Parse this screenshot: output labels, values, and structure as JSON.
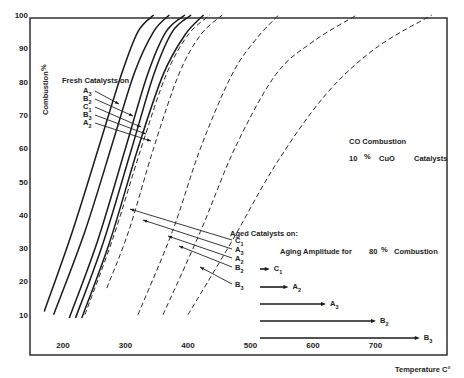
{
  "chart_data": {
    "type": "line",
    "title": "CO Combustion",
    "subtitle": "10 % CuO Catalysts",
    "xlabel": "Temperature C°",
    "ylabel": "Combustion %",
    "xlim": [
      150,
      810
    ],
    "ylim": [
      0,
      100
    ],
    "x_ticks": [
      "200",
      "300",
      "400",
      "500",
      "600",
      "700"
    ],
    "y_ticks": [
      "10",
      "20",
      "30",
      "40",
      "50",
      "60",
      "70",
      "80",
      "90",
      "100"
    ],
    "grid": false,
    "series_groups": {
      "fresh": {
        "label": "Fresh Catalysts on",
        "style": "solid",
        "legend_order": [
          "A3",
          "B2",
          "C1",
          "B3",
          "A2"
        ]
      },
      "aged": {
        "label": "Aged Catalysts on:",
        "style": "dashed",
        "legend_order": [
          "C1",
          "A3",
          "A2",
          "B2",
          "B3"
        ]
      }
    },
    "series": [
      {
        "name": "Fresh A3",
        "group": "fresh",
        "x": [
          170,
          215,
          260,
          295,
          320,
          345
        ],
        "y": [
          11,
          35,
          62,
          83,
          95,
          100
        ]
      },
      {
        "name": "Fresh B2",
        "group": "fresh",
        "x": [
          185,
          235,
          280,
          315,
          345,
          370
        ],
        "y": [
          10,
          35,
          62,
          83,
          95,
          100
        ]
      },
      {
        "name": "Fresh C1",
        "group": "fresh",
        "x": [
          210,
          255,
          300,
          335,
          365,
          395
        ],
        "y": [
          9,
          32,
          60,
          82,
          95,
          100
        ]
      },
      {
        "name": "Fresh B3",
        "group": "fresh",
        "x": [
          220,
          265,
          310,
          345,
          375,
          405
        ],
        "y": [
          9,
          32,
          60,
          82,
          95,
          100
        ]
      },
      {
        "name": "Fresh A2",
        "group": "fresh",
        "x": [
          230,
          275,
          320,
          360,
          395,
          425
        ],
        "y": [
          9,
          32,
          60,
          82,
          94,
          100
        ]
      },
      {
        "name": "Aged C1",
        "group": "aged",
        "x": [
          235,
          280,
          325,
          365,
          400,
          435
        ],
        "y": [
          10,
          33,
          60,
          82,
          94,
          100
        ]
      },
      {
        "name": "Aged A3",
        "group": "aged",
        "x": [
          270,
          305,
          345,
          385,
          420,
          455
        ],
        "y": [
          18,
          35,
          60,
          82,
          94,
          100
        ]
      },
      {
        "name": "Aged A2",
        "group": "aged",
        "x": [
          320,
          375,
          420,
          470,
          510,
          545
        ],
        "y": [
          10,
          35,
          60,
          82,
          93,
          100
        ]
      },
      {
        "name": "Aged B2",
        "group": "aged",
        "x": [
          360,
          420,
          475,
          540,
          600,
          670
        ],
        "y": [
          10,
          35,
          60,
          82,
          92,
          100
        ]
      },
      {
        "name": "Aged B3",
        "group": "aged",
        "x": [
          400,
          470,
          540,
          620,
          700,
          790
        ],
        "y": [
          10,
          32,
          55,
          76,
          90,
          100
        ]
      }
    ],
    "annotations": {
      "aging_amplitude_title": "Aging Amplitude for 80% Combustion",
      "aging_amplitude_arrows": [
        {
          "label": "C1",
          "x_start": 510,
          "x_end": 550,
          "y_pos": 24
        },
        {
          "label": "A2",
          "x_start": 510,
          "x_end": 580,
          "y_pos": 18
        },
        {
          "label": "A3",
          "x_start": 510,
          "x_end": 640,
          "y_pos": 13
        },
        {
          "label": "B2",
          "x_start": 510,
          "x_end": 720,
          "y_pos": 8
        },
        {
          "label": "B3",
          "x_start": 510,
          "x_end": 790,
          "y_pos": 3
        }
      ]
    }
  },
  "labels": {
    "y_axis_title": "Combustion",
    "y_axis_unit": "%",
    "x_axis_title": "Temperature C°",
    "title_line1": "CO Combustion",
    "title_line2_a": "10",
    "title_line2_pct": "%",
    "title_line2_b": "CuO",
    "title_line2_c": "Catalysts",
    "fresh_header": "Fresh Catalysts on",
    "aged_header": "Aged Catalysts on:",
    "amp_header_a": "Aging Amplitude for",
    "amp_header_b": "80",
    "amp_header_pct": "%",
    "amp_header_c": "Combustion"
  }
}
